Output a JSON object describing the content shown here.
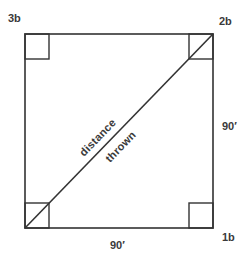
{
  "diagram": {
    "type": "baseball-diamond-geometry",
    "bases": {
      "third": "3b",
      "second": "2b",
      "first": "1b"
    },
    "side_labels": {
      "right": "90′",
      "bottom": "90′"
    },
    "diagonal_label": {
      "upper": "distance",
      "lower": "thrown"
    },
    "colors": {
      "stroke": "#333333",
      "text": "#3a3a3a",
      "background": "#ffffff"
    }
  }
}
